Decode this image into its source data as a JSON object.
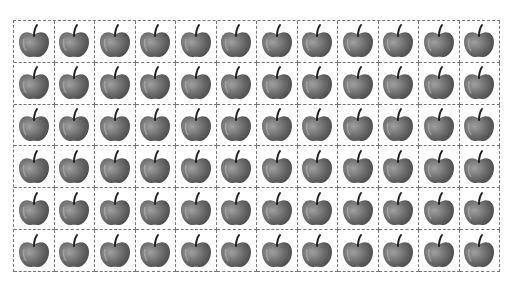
{
  "worksheet": {
    "rows": 6,
    "columns": 12,
    "total_items": 72,
    "item_icon": "apple-icon",
    "colors": {
      "apple_body": "#6e6e6e",
      "apple_highlight": "#9a9a9a",
      "stem": "#222222",
      "cell_border": "#777777"
    }
  }
}
